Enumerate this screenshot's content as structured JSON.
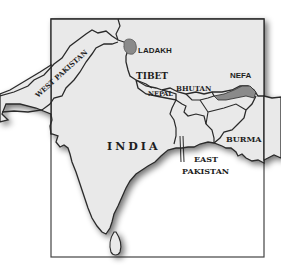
{
  "map": {
    "type": "political-outline",
    "region": "South Asia",
    "labels": {
      "india": "INDIA",
      "west_pakistan": "WEST PAKISTAN",
      "east_pakistan_line1": "EAST",
      "east_pakistan_line2": "PAKISTAN",
      "ladakh": "LADAKH",
      "tibet": "TIBET",
      "nepal": "NEPAL",
      "bhutan": "BHUTAN",
      "nefa": "NEFA",
      "burma": "BURMA"
    },
    "colors": {
      "land": "#e9e9e9",
      "water": "#ffffff",
      "border": "#2a2a2a",
      "disputed_region": "#8a8a8a",
      "frame": "#444444",
      "coast_shadow": "#9a9a9a"
    },
    "disputed_regions": [
      "LADAKH",
      "NEFA"
    ]
  }
}
